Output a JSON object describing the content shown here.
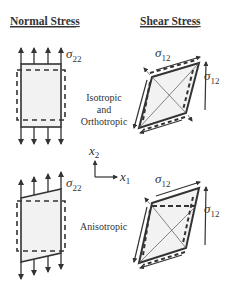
{
  "headers": {
    "normal": "Normal Stress",
    "shear": "Shear Stress"
  },
  "center_labels": {
    "iso_line1": "Isotropic",
    "iso_line2": "and",
    "iso_line3": "Orthotropic",
    "aniso": "Anisotropic"
  },
  "symbols": {
    "sigma": "σ",
    "normal_sub": "22",
    "shear_sub": "12"
  },
  "axes": {
    "vertical": "x",
    "vertical_sub": "2",
    "horizontal": "x",
    "horizontal_sub": "1"
  },
  "colors": {
    "stroke": "#333333",
    "fill": "#f2f2f2",
    "background": "#ffffff"
  }
}
